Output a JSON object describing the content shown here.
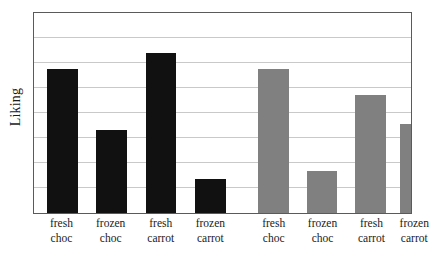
{
  "chart_data": {
    "type": "bar",
    "title": "",
    "subtitle": "",
    "xlabel": "",
    "ylabel": "Liking",
    "ylim": [
      0,
      8
    ],
    "grid": true,
    "gridlines": [
      1,
      2,
      3,
      4,
      5,
      6,
      7
    ],
    "y_tick_labels": [],
    "legend": false,
    "legend_position": "none",
    "categories": [
      "fresh choc",
      "frozen choc",
      "fresh carrot",
      "frozen carrot",
      "fresh choc",
      "frozen choc",
      "fresh carrot",
      "frozen carrot"
    ],
    "category_lines": [
      [
        "fresh",
        "choc"
      ],
      [
        "frozen",
        "choc"
      ],
      [
        "fresh",
        "carrot"
      ],
      [
        "frozen",
        "carrot"
      ],
      [
        "fresh",
        "choc"
      ],
      [
        "frozen",
        "choc"
      ],
      [
        "fresh",
        "carrot"
      ],
      [
        "frozen",
        "carrot"
      ]
    ],
    "values": [
      5.75,
      3.33,
      6.42,
      1.35,
      5.75,
      1.67,
      4.71,
      3.57
    ],
    "bar_colors": [
      "#111111",
      "#111111",
      "#111111",
      "#111111",
      "#808080",
      "#808080",
      "#808080",
      "#808080"
    ],
    "groups": [
      {
        "name": "group-1",
        "color": "#111111",
        "categories": [
          "fresh choc",
          "frozen choc",
          "fresh carrot",
          "frozen carrot"
        ],
        "values": [
          5.75,
          3.33,
          6.42,
          1.35
        ]
      },
      {
        "name": "group-2",
        "color": "#808080",
        "categories": [
          "fresh choc",
          "frozen choc",
          "fresh carrot",
          "frozen carrot"
        ],
        "values": [
          5.75,
          1.67,
          4.71,
          3.57
        ]
      }
    ],
    "bar_geometry": [
      {
        "left_pct": 3.4,
        "width_pct": 8.2
      },
      {
        "left_pct": 16.4,
        "width_pct": 8.2
      },
      {
        "left_pct": 29.6,
        "width_pct": 8.2
      },
      {
        "left_pct": 42.7,
        "width_pct": 8.2
      },
      {
        "left_pct": 59.4,
        "width_pct": 8.2
      },
      {
        "left_pct": 72.3,
        "width_pct": 8.2
      },
      {
        "left_pct": 85.2,
        "width_pct": 8.2
      },
      {
        "left_pct": 97.0,
        "width_pct": 8.2
      }
    ],
    "label_geometry": [
      {
        "center_pct": 7.5
      },
      {
        "center_pct": 20.5
      },
      {
        "center_pct": 33.7
      },
      {
        "center_pct": 46.8
      },
      {
        "center_pct": 63.5
      },
      {
        "center_pct": 76.4
      },
      {
        "center_pct": 89.3
      },
      {
        "center_pct": 100.6
      }
    ],
    "frame_color": "#5a5a5a",
    "grid_color": "#c9c9c9",
    "background": "#ffffff"
  }
}
